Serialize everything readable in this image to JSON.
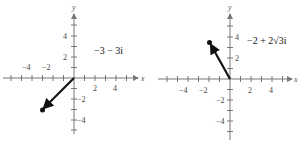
{
  "figures": [
    {
      "id": "left",
      "label": "−3 − 3i",
      "point": {
        "re": -3,
        "im": -3
      },
      "x_axis_label": "x",
      "y_axis_label": "y",
      "x_tick_labels": [
        "−4",
        "−2",
        "2",
        "4"
      ],
      "y_tick_labels": [
        "4",
        "2",
        "−2",
        "−4"
      ]
    },
    {
      "id": "right",
      "label": "−2 + 2√3i",
      "point": {
        "re": -2,
        "im": 3.464
      },
      "x_axis_label": "x",
      "y_axis_label": "y",
      "x_tick_labels": [
        "−4",
        "−2",
        "2",
        "4"
      ],
      "y_tick_labels": [
        "4",
        "2",
        "−2",
        "−4"
      ]
    }
  ],
  "colors": {
    "axis": "#777777",
    "vector": "#111111",
    "text": "#444444"
  }
}
